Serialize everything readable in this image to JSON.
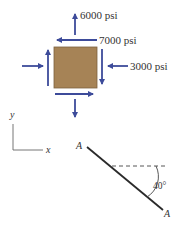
{
  "stress_element": {
    "fill_color": "#a68356",
    "arrow_color": "#3d4b9a",
    "labels": {
      "top": "6000 psi",
      "shear": "7000 psi",
      "right": "3000 psi"
    }
  },
  "axes": {
    "y_label": "y",
    "x_label": "x"
  },
  "plane": {
    "end_label_top": "A",
    "end_label_bottom": "A",
    "angle_label": "40°"
  }
}
